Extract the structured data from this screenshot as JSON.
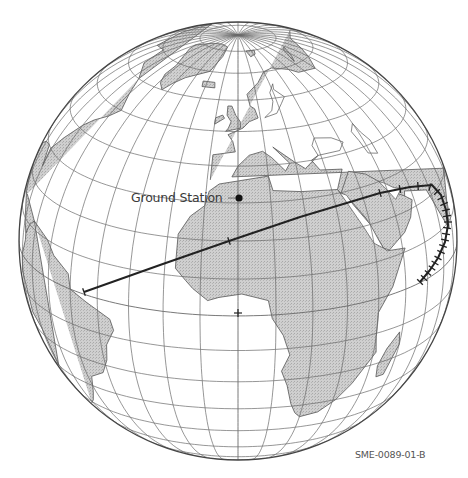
{
  "figure": {
    "id_label": "SME-0089-01-B",
    "projection": "orthographic",
    "center_px": [
      238,
      241
    ],
    "radius_px": 219,
    "view_center": {
      "lat": 20,
      "lon": 0
    },
    "graticule_step_deg": 10,
    "colors": {
      "land": "#c9c9c9",
      "land_stroke": "#555555",
      "grid": "#6a6a6a",
      "track": "#222222",
      "outline": "#444444"
    }
  },
  "ground_station": {
    "label": "Ground Station",
    "marker_px": [
      239,
      198
    ]
  },
  "equator_marker_px": [
    238,
    313
  ],
  "track": {
    "points_px": [
      [
        84,
        292
      ],
      [
        160,
        265
      ],
      [
        229,
        241
      ],
      [
        300,
        217
      ],
      [
        380,
        193
      ],
      [
        410,
        187
      ],
      [
        432,
        185
      ],
      [
        441,
        195
      ],
      [
        446,
        210
      ],
      [
        448,
        225
      ],
      [
        445,
        242
      ],
      [
        438,
        258
      ],
      [
        430,
        270
      ],
      [
        420,
        282
      ]
    ],
    "ticks_px": [
      [
        84,
        292
      ],
      [
        229,
        241
      ],
      [
        380,
        193
      ],
      [
        400,
        189
      ],
      [
        418,
        186
      ],
      [
        430,
        187
      ],
      [
        437,
        192
      ],
      [
        441,
        198
      ],
      [
        444,
        204
      ],
      [
        446,
        210
      ],
      [
        447,
        216
      ],
      [
        448,
        222
      ],
      [
        447,
        228
      ],
      [
        446,
        234
      ],
      [
        445,
        240
      ],
      [
        443,
        246
      ],
      [
        441,
        252
      ],
      [
        438,
        258
      ],
      [
        435,
        263
      ],
      [
        432,
        268
      ],
      [
        428,
        273
      ],
      [
        424,
        278
      ],
      [
        420,
        282
      ]
    ]
  }
}
